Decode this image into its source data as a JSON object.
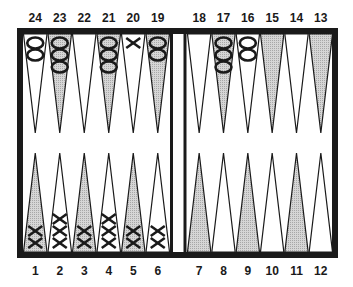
{
  "board": {
    "title": "Backgammon board position",
    "colors": {
      "frame": "#1a1a1a",
      "shaded_point": "#c8c8c8",
      "white_point": "#ffffff",
      "checker_stroke": "#1a1a1a"
    },
    "top_labels": [
      "24",
      "23",
      "22",
      "21",
      "20",
      "19",
      "18",
      "17",
      "16",
      "15",
      "14",
      "13"
    ],
    "bottom_labels": [
      "1",
      "2",
      "3",
      "4",
      "5",
      "6",
      "7",
      "8",
      "9",
      "10",
      "11",
      "12"
    ],
    "points": [
      {
        "number": 24,
        "row": "top",
        "shaded": false,
        "checker": "O",
        "count": 2
      },
      {
        "number": 23,
        "row": "top",
        "shaded": true,
        "checker": "O",
        "count": 3
      },
      {
        "number": 22,
        "row": "top",
        "shaded": false,
        "checker": "",
        "count": 0
      },
      {
        "number": 21,
        "row": "top",
        "shaded": true,
        "checker": "O",
        "count": 3
      },
      {
        "number": 20,
        "row": "top",
        "shaded": false,
        "checker": "X",
        "count": 1
      },
      {
        "number": 19,
        "row": "top",
        "shaded": true,
        "checker": "O",
        "count": 2
      },
      {
        "number": 18,
        "row": "top",
        "shaded": false,
        "checker": "",
        "count": 0
      },
      {
        "number": 17,
        "row": "top",
        "shaded": true,
        "checker": "O",
        "count": 3
      },
      {
        "number": 16,
        "row": "top",
        "shaded": false,
        "checker": "O",
        "count": 2
      },
      {
        "number": 15,
        "row": "top",
        "shaded": true,
        "checker": "",
        "count": 0
      },
      {
        "number": 14,
        "row": "top",
        "shaded": false,
        "checker": "",
        "count": 0
      },
      {
        "number": 13,
        "row": "top",
        "shaded": true,
        "checker": "",
        "count": 0
      },
      {
        "number": 1,
        "row": "bottom",
        "shaded": true,
        "checker": "X",
        "count": 2
      },
      {
        "number": 2,
        "row": "bottom",
        "shaded": false,
        "checker": "X",
        "count": 3
      },
      {
        "number": 3,
        "row": "bottom",
        "shaded": true,
        "checker": "X",
        "count": 2
      },
      {
        "number": 4,
        "row": "bottom",
        "shaded": false,
        "checker": "X",
        "count": 3
      },
      {
        "number": 5,
        "row": "bottom",
        "shaded": true,
        "checker": "X",
        "count": 2
      },
      {
        "number": 6,
        "row": "bottom",
        "shaded": false,
        "checker": "X",
        "count": 2
      },
      {
        "number": 7,
        "row": "bottom",
        "shaded": true,
        "checker": "",
        "count": 0
      },
      {
        "number": 8,
        "row": "bottom",
        "shaded": false,
        "checker": "",
        "count": 0
      },
      {
        "number": 9,
        "row": "bottom",
        "shaded": true,
        "checker": "",
        "count": 0
      },
      {
        "number": 10,
        "row": "bottom",
        "shaded": false,
        "checker": "",
        "count": 0
      },
      {
        "number": 11,
        "row": "bottom",
        "shaded": true,
        "checker": "",
        "count": 0
      },
      {
        "number": 12,
        "row": "bottom",
        "shaded": false,
        "checker": "",
        "count": 0
      }
    ]
  }
}
